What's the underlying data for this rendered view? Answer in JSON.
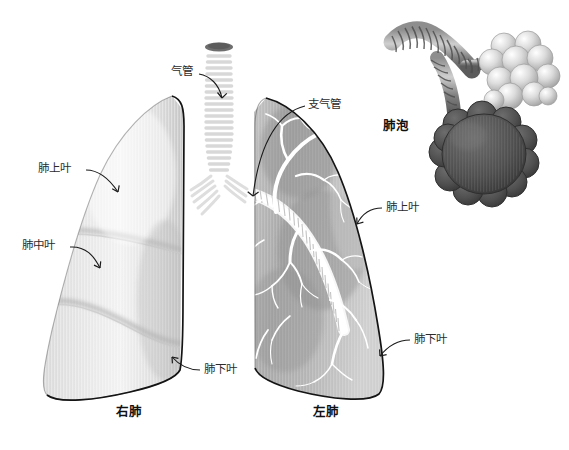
{
  "figure": {
    "background_color": "#ffffff"
  },
  "labels": {
    "trachea": "气管",
    "bronchus": "支气管",
    "alveoli": "肺泡",
    "right_upper_lobe": "肺上叶",
    "right_middle_lobe": "肺中叶",
    "right_lower_lobe": "肺下叶",
    "left_upper_lobe": "肺上叶",
    "left_lower_lobe": "肺下叶"
  },
  "captions": {
    "right_lung": "右肺",
    "left_lung": "左肺"
  },
  "colors": {
    "lung_light": "#e3e3e3",
    "lung_mid": "#c9c9c9",
    "lung_dark": "#9a9a9a",
    "airway_white": "#fbfbfb",
    "outline": "#1d1d1d",
    "label_text": "#2b2b2b",
    "alveolus_dark": "#4a4a4a",
    "alveolus_light": "#d0d0d0",
    "trachea_top": "#6e6e6e"
  },
  "parts": {
    "trachea_icon": "trachea-tube",
    "bronchus_icon": "bronchus-tube",
    "bronchial_tree_icon": "bronchial-tree",
    "alveolar_cluster_icon": "alveolar-cluster",
    "alveolar_sac_icon": "alveolar-sac",
    "right_lung_icon": "right-lung-body",
    "left_lung_icon": "left-lung-body"
  }
}
